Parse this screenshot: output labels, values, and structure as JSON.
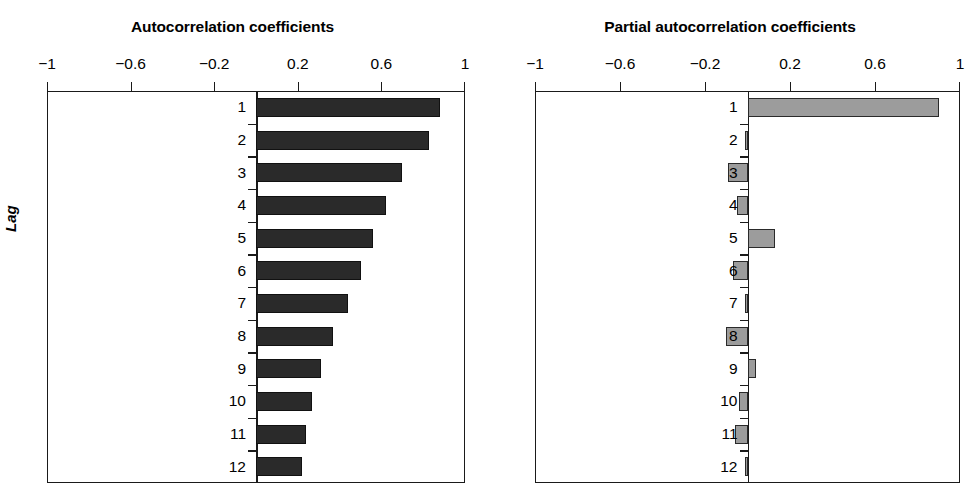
{
  "figure": {
    "clipped_caption_remnant": "",
    "ylabel": "Lag",
    "background": "#ffffff"
  },
  "axis": {
    "tick_labels": [
      "−1",
      "−0.6",
      "−0.2",
      "0.2",
      "0.6",
      "1"
    ],
    "tick_values": [
      -1,
      -0.6,
      -0.2,
      0.2,
      0.6,
      1
    ],
    "xlim": [
      -1,
      1
    ]
  },
  "lags": [
    "1",
    "2",
    "3",
    "4",
    "5",
    "6",
    "7",
    "8",
    "9",
    "10",
    "11",
    "12"
  ],
  "left_panel": {
    "title": "Autocorrelation coefficients",
    "bar_color": "#2a2a2a"
  },
  "right_panel": {
    "title": "Partial autocorrelation coefficients",
    "bar_color": "#9c9c9c"
  },
  "chart_data": [
    {
      "type": "bar",
      "orientation": "horizontal",
      "title": "Autocorrelation coefficients",
      "xlabel": "",
      "ylabel": "Lag",
      "xlim": [
        -1,
        1
      ],
      "xticks": [
        -1,
        -0.6,
        -0.2,
        0.2,
        0.6,
        1
      ],
      "xticklabels": [
        "−1",
        "−0.6",
        "−0.2",
        "0.2",
        "0.6",
        "1"
      ],
      "grid": false,
      "legend": null,
      "categories": [
        "1",
        "2",
        "3",
        "4",
        "5",
        "6",
        "7",
        "8",
        "9",
        "10",
        "11",
        "12"
      ],
      "values": [
        0.88,
        0.83,
        0.7,
        0.62,
        0.56,
        0.5,
        0.44,
        0.37,
        0.31,
        0.27,
        0.24,
        0.22
      ]
    },
    {
      "type": "bar",
      "orientation": "horizontal",
      "title": "Partial autocorrelation coefficients",
      "xlabel": "",
      "ylabel": "Lag",
      "xlim": [
        -1,
        1
      ],
      "xticks": [
        -1,
        -0.6,
        -0.2,
        0.2,
        0.6,
        1
      ],
      "xticklabels": [
        "−1",
        "−0.6",
        "−0.2",
        "0.2",
        "0.6",
        "1"
      ],
      "grid": false,
      "legend": null,
      "categories": [
        "1",
        "2",
        "3",
        "4",
        "5",
        "6",
        "7",
        "8",
        "9",
        "10",
        "11",
        "12"
      ],
      "values": [
        0.9,
        -0.01,
        -0.09,
        -0.05,
        0.13,
        -0.07,
        -0.01,
        -0.1,
        0.04,
        -0.04,
        -0.06,
        -0.01
      ]
    }
  ]
}
